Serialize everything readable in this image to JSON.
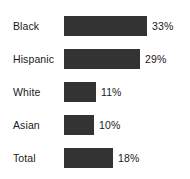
{
  "chart_data": {
    "type": "bar",
    "orientation": "horizontal",
    "title": "",
    "subtitle": "",
    "xlabel": "",
    "ylabel": "",
    "grid": false,
    "legend": false,
    "legend_position": "none",
    "axis_visible": false,
    "tick_labels": [],
    "xlim": [
      0,
      33
    ],
    "categories": [
      "Black",
      "Hispanic",
      "White",
      "Asian",
      "Total"
    ],
    "values": [
      33,
      29,
      11,
      10,
      18
    ],
    "value_labels": [
      "33%",
      "29%",
      "11%",
      "10%",
      "18%"
    ],
    "bars": [
      {
        "category": "Black",
        "value": 33,
        "label": "33%",
        "bar_px": 83,
        "row_top": 15
      },
      {
        "category": "Hispanic",
        "value": 29,
        "label": "29%",
        "bar_px": 76,
        "row_top": 48
      },
      {
        "category": "White",
        "value": 11,
        "label": "11%",
        "bar_px": 32,
        "row_top": 81
      },
      {
        "category": "Asian",
        "value": 10,
        "label": "10%",
        "bar_px": 30,
        "row_top": 114
      },
      {
        "category": "Total",
        "value": 18,
        "label": "18%",
        "bar_px": 49,
        "row_top": 147
      }
    ],
    "colors": {
      "bar": "#333333",
      "background": "#ffffff",
      "text": "#1a1a1a"
    }
  }
}
